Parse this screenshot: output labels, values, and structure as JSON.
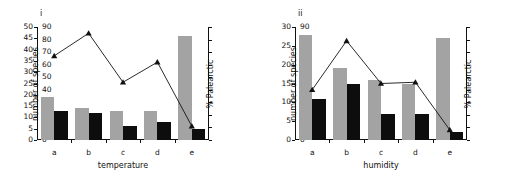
{
  "figure": {
    "panels": [
      {
        "id": "i",
        "label": "i",
        "xlabel": "temperature",
        "ylabel_left": "number of species",
        "ylabel_right": "% Palearctic",
        "categories": [
          "a",
          "b",
          "c",
          "d",
          "e"
        ],
        "left_ticks": [
          "0",
          "5",
          "10",
          "15",
          "20",
          "25",
          "30",
          "35",
          "40",
          "45",
          "50"
        ],
        "right_ticks": [
          "0",
          "10",
          "20",
          "30",
          "40",
          "50",
          "60",
          "70",
          "80",
          "90"
        ],
        "chart_data": {
          "type": "bar",
          "title": "i",
          "xlabel": "temperature",
          "ylabel": "number of species",
          "ylabel2": "% Palearctic",
          "categories": [
            "a",
            "b",
            "c",
            "d",
            "e"
          ],
          "ylim": [
            0,
            50
          ],
          "ylim2": [
            0,
            90
          ],
          "grid": false,
          "legend": "none",
          "series": [
            {
              "name": "number of species (grey bars)",
              "type": "bar",
              "color": "#a3a3a3",
              "axis": "left",
              "values": [
                19,
                14,
                13,
                13,
                46
              ]
            },
            {
              "name": "number of species (black bars)",
              "type": "bar",
              "color": "#0d0d0d",
              "axis": "left",
              "values": [
                13,
                12,
                6,
                8,
                5
              ]
            },
            {
              "name": "% Palearctic",
              "type": "line",
              "color": "#111111",
              "marker": "triangle",
              "axis": "right",
              "values": [
                67,
                85,
                46,
                62,
                11
              ]
            }
          ]
        }
      },
      {
        "id": "ii",
        "label": "ii",
        "xlabel": "humidity",
        "ylabel_left": "number of species",
        "ylabel_right": "% Palearctic",
        "categories": [
          "a",
          "b",
          "c",
          "d",
          "e"
        ],
        "left_ticks": [
          "0",
          "5",
          "10",
          "15",
          "20",
          "25",
          "30"
        ],
        "right_ticks": [
          "0",
          "10",
          "20",
          "30",
          "40",
          "50",
          "60",
          "70",
          "80",
          "90"
        ],
        "chart_data": {
          "type": "bar",
          "title": "ii",
          "xlabel": "humidity",
          "ylabel": "number of species",
          "ylabel2": "% Palearctic",
          "categories": [
            "a",
            "b",
            "c",
            "d",
            "e"
          ],
          "ylim": [
            0,
            30
          ],
          "ylim2": [
            0,
            90
          ],
          "grid": false,
          "legend": "none",
          "series": [
            {
              "name": "number of species (grey bars)",
              "type": "bar",
              "color": "#a3a3a3",
              "axis": "left",
              "values": [
                28,
                19,
                16,
                15,
                27
              ]
            },
            {
              "name": "number of species (black bars)",
              "type": "bar",
              "color": "#0d0d0d",
              "axis": "left",
              "values": [
                11,
                15,
                7,
                7,
                2
              ]
            },
            {
              "name": "% Palearctic",
              "type": "line",
              "color": "#111111",
              "marker": "triangle",
              "axis": "right",
              "values": [
                40,
                79,
                45,
                46,
                8
              ]
            }
          ]
        }
      }
    ]
  }
}
